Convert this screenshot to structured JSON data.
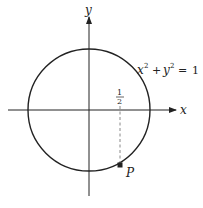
{
  "diagram": {
    "type": "unit-circle",
    "equation": {
      "x_term": "x",
      "x_exp": "2",
      "plus": "+",
      "y_term": "y",
      "y_exp": "2",
      "equals": "=",
      "rhs": "1"
    },
    "axes": {
      "x_label": "x",
      "y_label": "y"
    },
    "tick": {
      "numerator": "1",
      "denominator": "2"
    },
    "point": {
      "label": "P"
    },
    "colors": {
      "stroke": "#222222",
      "dashed": "#888888"
    }
  }
}
